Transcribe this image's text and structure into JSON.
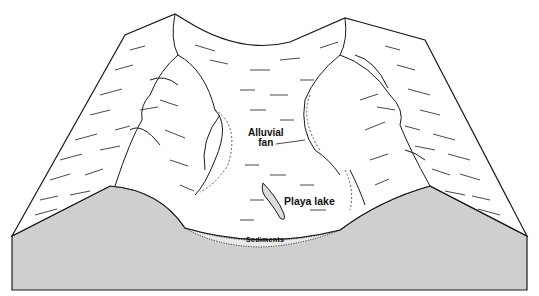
{
  "diagram": {
    "labels": {
      "alluvial_fan_line1": "Alluvial",
      "alluvial_fan_line2": "fan",
      "playa_lake": "Playa lake",
      "sediments": "Sediments"
    },
    "colors": {
      "line": "#1a1a1a",
      "surface": "#ffffff",
      "block_side": "#cfcfcf",
      "sediment_fill": "#e8e8e8"
    }
  }
}
